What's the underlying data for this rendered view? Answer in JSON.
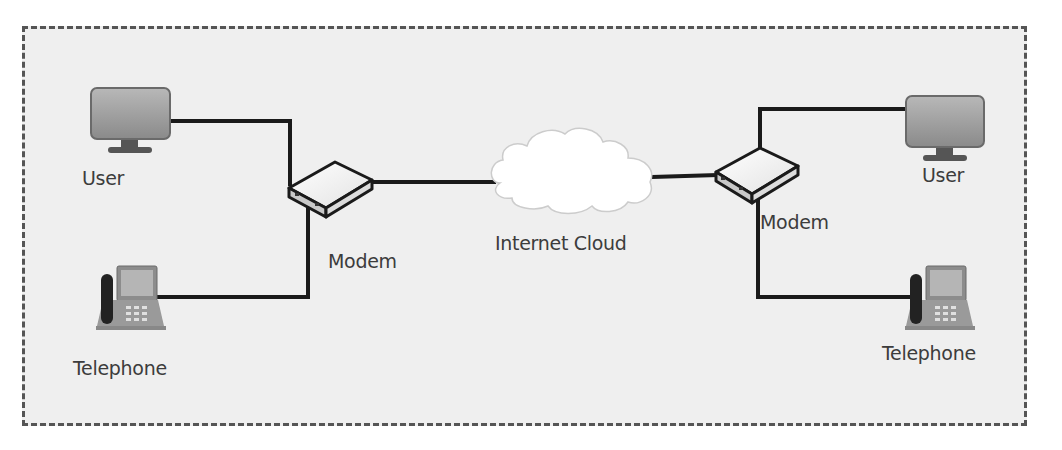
{
  "diagram": {
    "type": "network-topology",
    "colors": {
      "background": "#efefef",
      "border": "#555555",
      "link": "#1a1a1a",
      "cloud_fill": "#ffffff",
      "device_fill": "#9a9a9a",
      "label_text": "#3c3c3c"
    },
    "nodes": [
      {
        "id": "user-left",
        "kind": "computer",
        "label": "User"
      },
      {
        "id": "telephone-left",
        "kind": "telephone",
        "label": "Telephone"
      },
      {
        "id": "modem-left",
        "kind": "modem",
        "label": "Modem"
      },
      {
        "id": "internet-cloud",
        "kind": "cloud",
        "label": "Internet Cloud"
      },
      {
        "id": "modem-right",
        "kind": "modem",
        "label": "Modem"
      },
      {
        "id": "user-right",
        "kind": "computer",
        "label": "User"
      },
      {
        "id": "telephone-right",
        "kind": "telephone",
        "label": "Telephone"
      }
    ],
    "edges": [
      {
        "from": "user-left",
        "to": "modem-left"
      },
      {
        "from": "telephone-left",
        "to": "modem-left"
      },
      {
        "from": "modem-left",
        "to": "internet-cloud"
      },
      {
        "from": "internet-cloud",
        "to": "modem-right"
      },
      {
        "from": "modem-right",
        "to": "user-right"
      },
      {
        "from": "modem-right",
        "to": "telephone-right"
      }
    ]
  },
  "labels": {
    "user_left": "User",
    "telephone_left": "Telephone",
    "modem_left": "Modem",
    "cloud": "Internet Cloud",
    "modem_right": "Modem",
    "user_right": "User",
    "telephone_right": "Telephone"
  }
}
